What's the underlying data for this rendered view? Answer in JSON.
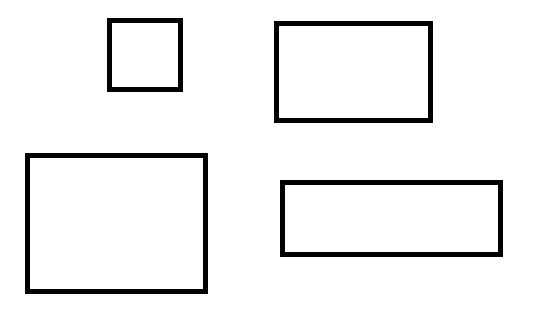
{
  "canvas": {
    "width": 534,
    "height": 309,
    "background": "#ffffff"
  },
  "shapes": [
    {
      "id": "rect-1",
      "type": "rectangle",
      "x": 107,
      "y": 18,
      "width": 76,
      "height": 74,
      "stroke": "#000000",
      "stroke_width": 5,
      "fill": "none"
    },
    {
      "id": "rect-2",
      "type": "rectangle",
      "x": 274,
      "y": 21,
      "width": 159,
      "height": 102,
      "stroke": "#000000",
      "stroke_width": 5,
      "fill": "none"
    },
    {
      "id": "rect-3",
      "type": "rectangle",
      "x": 25,
      "y": 153,
      "width": 183,
      "height": 141,
      "stroke": "#000000",
      "stroke_width": 5,
      "fill": "none"
    },
    {
      "id": "rect-4",
      "type": "rectangle",
      "x": 280,
      "y": 180,
      "width": 223,
      "height": 77,
      "stroke": "#000000",
      "stroke_width": 5,
      "fill": "none"
    }
  ]
}
